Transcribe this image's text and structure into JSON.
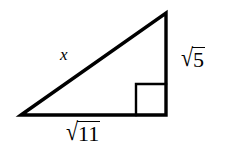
{
  "figure": {
    "type": "right-triangle-diagram",
    "background_color": "#ffffff",
    "stroke_color": "#000000",
    "labels": {
      "hypotenuse": "x",
      "vertical_leg": {
        "radix": "√",
        "radicand": "5"
      },
      "horizontal_leg": {
        "radix": "√",
        "radicand": "11"
      }
    },
    "geometry": {
      "left_vertex": [
        21,
        115
      ],
      "apex_vertex": [
        166,
        13
      ],
      "right_vertex": [
        166,
        115
      ],
      "right_angle_marker": {
        "x": 136,
        "y": 84,
        "size": 31
      }
    }
  }
}
